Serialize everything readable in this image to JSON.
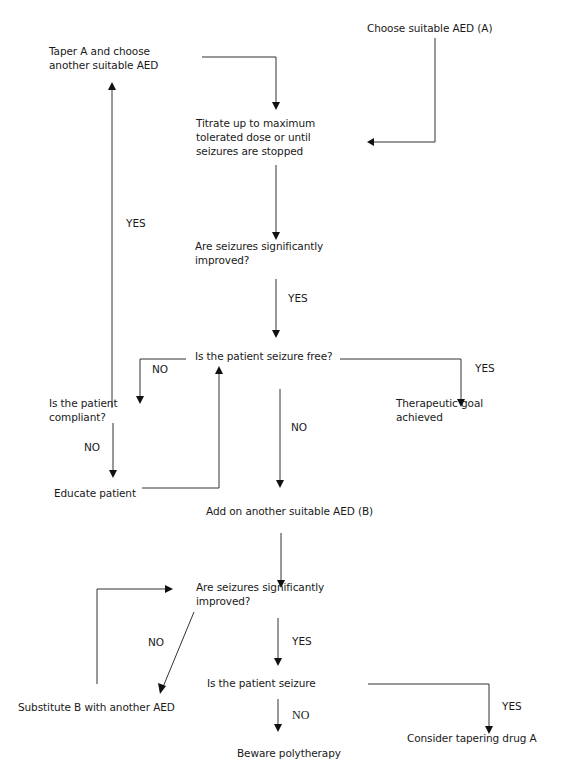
{
  "diagram": {
    "nodes": {
      "choose_aed_a": "Choose suitable AED (A)",
      "taper_a": "Taper A and choose\nanother suitable AED",
      "titrate": "Titrate up to maximum\ntolerated dose or until\nseizures are stopped",
      "improved_1": "Are seizures significantly\nimproved?",
      "seizure_free_1": "Is the patient seizure free?",
      "compliant": "Is the patient\ncompliant?",
      "therapeutic_goal": "Therapeutic goal\nachieved",
      "educate": "Educate patient",
      "add_on_b": "Add on another suitable AED (B)",
      "improved_2": "Are seizures significantly\nimproved?",
      "seizure_free_2": "Is the patient seizure",
      "substitute_b": "Substitute B with another AED",
      "consider_taper": "Consider tapering drug A",
      "beware": "Beware polytherapy"
    },
    "edge_labels": {
      "yes_compliant_to_taper": "YES",
      "yes_improved1": "YES",
      "no_seizure_free1": "NO",
      "yes_seizure_free1": "YES",
      "no_compliant": "NO",
      "no_seizure_free1_down": "NO",
      "no_improved2": "NO",
      "yes_improved2": "YES",
      "yes_seizure_free2": "YES",
      "no_seizure_free2": "NO"
    }
  }
}
